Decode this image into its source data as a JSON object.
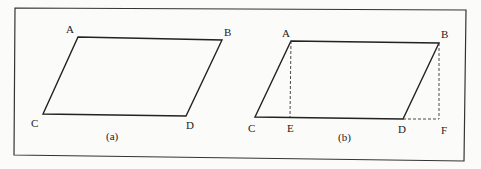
{
  "figure": {
    "panels": [
      {
        "caption": "(a)",
        "vertices": {
          "A": "A",
          "B": "B",
          "C": "C",
          "D": "D"
        }
      },
      {
        "caption": "(b)",
        "vertices": {
          "A": "A",
          "B": "B",
          "C": "C",
          "D": "D",
          "E": "E",
          "F": "F"
        }
      }
    ],
    "colors": {
      "line": "#222222",
      "frame": "#333333",
      "background": "#fbfbf9"
    }
  }
}
